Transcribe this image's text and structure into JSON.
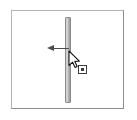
{
  "panel": {
    "name": "resize-panel",
    "background_color": "#ffffff",
    "border_color": "#b4b4b4",
    "border_shadow_color": "#8e8e8e"
  },
  "divider": {
    "label": "",
    "orientation": "vertical",
    "color_light": "#d9d9d9",
    "color_dark": "#9a9a9a",
    "border_color": "#8c8c8c"
  },
  "annotation": {
    "arrow_label": "",
    "direction": "left",
    "color": "#4c4c4c"
  },
  "cursor": {
    "icon": "mouse-pointer-icon",
    "fill_color": "#ffffff",
    "stroke_color": "#1a1a1a",
    "badge_icon": "drag-handle-badge-icon",
    "badge_border_color": "#3c3c3c"
  }
}
